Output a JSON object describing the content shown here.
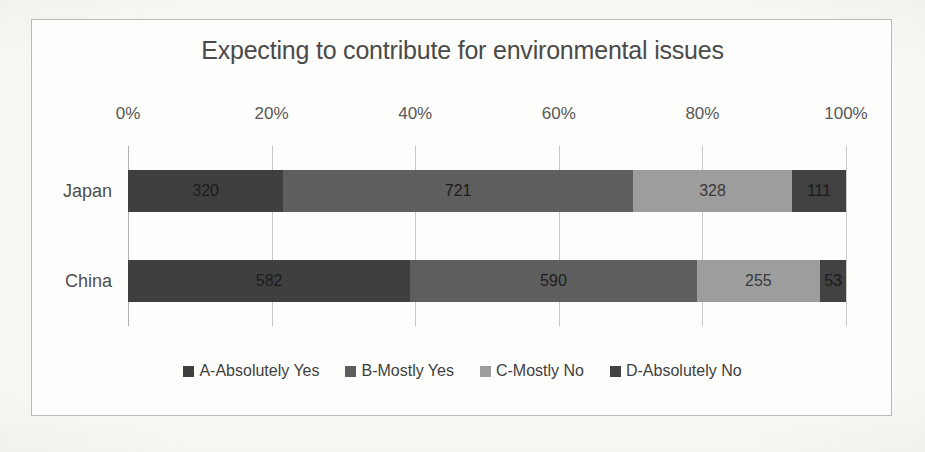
{
  "figure": {
    "background_color": "#fbfbf8",
    "frame_border_color": "#b9b9b5"
  },
  "chart_data": {
    "type": "bar",
    "orientation": "horizontal",
    "stacked": true,
    "normalized": true,
    "title": "Expecting to contribute for environmental issues",
    "xlabel": "",
    "ylabel": "",
    "xlim": [
      0,
      100
    ],
    "grid": true,
    "grid_axis": "x",
    "legend_position": "bottom",
    "categories": [
      "Japan",
      "China"
    ],
    "xtick_labels": [
      "0%",
      "20%",
      "40%",
      "60%",
      "80%",
      "100%"
    ],
    "xtick_values": [
      0,
      20,
      40,
      60,
      80,
      100
    ],
    "series": [
      {
        "name": "A-Absolutely Yes",
        "color": "#3f3f3f",
        "shade": "dark",
        "values": [
          320,
          582
        ]
      },
      {
        "name": "B-Mostly Yes",
        "color": "#5e5e5e",
        "shade": "dark",
        "values": [
          721,
          590
        ]
      },
      {
        "name": "C-Mostly No",
        "color": "#9d9d9d",
        "shade": "light",
        "values": [
          328,
          255
        ]
      },
      {
        "name": "D-Absolutely No",
        "color": "#424242",
        "shade": "dark",
        "values": [
          111,
          53
        ]
      }
    ],
    "row_totals": [
      1480,
      1480
    ],
    "data_labels": [
      [
        "320",
        "721",
        "328",
        "111"
      ],
      [
        "582",
        "590",
        "255",
        "53"
      ]
    ]
  }
}
